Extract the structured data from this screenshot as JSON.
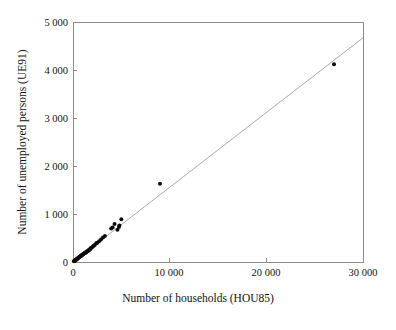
{
  "chart_data": {
    "type": "scatter",
    "title": "",
    "xlabel": "Number of households (HOU85)",
    "ylabel": "Number of unemployed persons (UE91)",
    "xlim": [
      0,
      30000
    ],
    "ylim": [
      0,
      5000
    ],
    "xticks": [
      0,
      10000,
      20000,
      30000
    ],
    "yticks": [
      0,
      1000,
      2000,
      3000,
      4000,
      5000
    ],
    "xtick_labels": [
      "0",
      "10 000",
      "20 000",
      "30 000"
    ],
    "ytick_labels": [
      "0",
      "1 000",
      "2 000",
      "3 000",
      "4 000",
      "5 000"
    ],
    "grid": false,
    "legend": "none",
    "point_color": "#0d0d0d",
    "line_color": "#a0a0a0",
    "frame_color": "#8c8c8c",
    "fit_line": {
      "label": "regression line",
      "x": [
        0,
        30000
      ],
      "y": [
        0,
        4670
      ]
    },
    "x": [
      27000,
      9000,
      5000,
      4800,
      4750,
      4600,
      4300,
      4100,
      3950,
      3300,
      3100,
      2900,
      2700,
      2500,
      2400,
      2250,
      2150,
      2050,
      1950,
      1850,
      1800,
      1750,
      1700,
      1650,
      1600,
      1550,
      1500,
      1450,
      1400,
      1350,
      1300,
      1250,
      1200,
      1150,
      1100,
      1050,
      1000,
      950,
      900,
      850,
      800,
      760,
      720,
      680,
      640,
      600,
      560,
      520,
      480,
      440,
      400,
      370,
      340,
      310,
      280,
      250,
      220,
      190,
      160,
      130,
      100
    ],
    "y": [
      4120,
      1630,
      890,
      760,
      730,
      670,
      790,
      720,
      700,
      540,
      510,
      470,
      430,
      400,
      390,
      355,
      340,
      325,
      300,
      290,
      275,
      265,
      255,
      250,
      240,
      235,
      225,
      220,
      215,
      205,
      200,
      190,
      185,
      175,
      170,
      160,
      155,
      145,
      140,
      130,
      125,
      118,
      112,
      105,
      100,
      94,
      88,
      82,
      75,
      70,
      64,
      58,
      54,
      48,
      44,
      40,
      35,
      30,
      26,
      21,
      16
    ]
  },
  "axis": {
    "y_title": "Number of unemployed persons (UE91)",
    "x_title": "Number of households (HOU85)"
  }
}
